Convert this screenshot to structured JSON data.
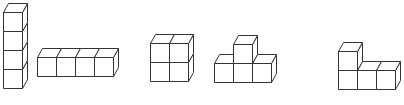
{
  "figure": {
    "stroke_color": "#333333",
    "fill_color": "#ffffff",
    "cube_size": 19,
    "depth_offset": {
      "dx": 5,
      "dy": -9
    }
  },
  "shapes": [
    {
      "name": "vertical-column-4",
      "cube_count": 4,
      "cubes": [
        [
          0,
          0
        ],
        [
          0,
          1
        ],
        [
          0,
          2
        ],
        [
          0,
          3
        ]
      ],
      "origin": [
        3,
        88
      ]
    },
    {
      "name": "horizontal-row-4",
      "cube_count": 4,
      "cubes": [
        [
          0,
          0
        ],
        [
          1,
          0
        ],
        [
          2,
          0
        ],
        [
          3,
          0
        ]
      ],
      "origin": [
        37,
        76
      ]
    },
    {
      "name": "square-2x2",
      "cube_count": 4,
      "cubes": [
        [
          0,
          0
        ],
        [
          1,
          0
        ],
        [
          0,
          1
        ],
        [
          1,
          1
        ]
      ],
      "origin": [
        150,
        81
      ]
    },
    {
      "name": "t-shape",
      "cube_count": 4,
      "cubes": [
        [
          0,
          0
        ],
        [
          1,
          0
        ],
        [
          2,
          0
        ],
        [
          1,
          1
        ]
      ],
      "origin": [
        214,
        82
      ]
    },
    {
      "name": "l-shape",
      "cube_count": 4,
      "cubes": [
        [
          0,
          0
        ],
        [
          1,
          0
        ],
        [
          2,
          0
        ],
        [
          0,
          1
        ]
      ],
      "origin": [
        338,
        89
      ]
    }
  ]
}
